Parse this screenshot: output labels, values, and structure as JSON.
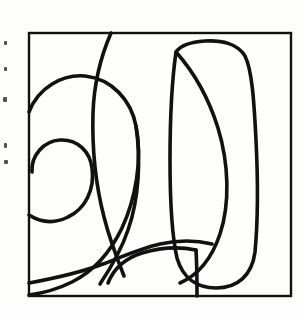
{
  "page": {
    "title": "Abstract Continuous-Line Drawing",
    "background_color": "#fdfdfc",
    "width": 304,
    "height": 314
  },
  "artwork": {
    "name": "abstract-line-drawing",
    "medium": "ink line drawing",
    "ink_color": "#111111",
    "paper_color": "#fdfdfc",
    "stroke_width": 3.6,
    "description": "A square frame enclosing a set of continuous flowing curves forming a spiral at left and a tall rounded loop at right.",
    "frame": {
      "name": "square-frame",
      "x": 29,
      "y": 33,
      "width": 262,
      "height": 263,
      "stroke_width": 2.4,
      "color": "#111111"
    },
    "paths": [
      {
        "name": "outer-spiral-arc",
        "d": "M 29 112 C 38 88, 62 74, 85 76 C 112 79, 131 100, 136 126 C 143 160, 135 200, 122 228 C 110 253, 92 272, 72 282 C 58 289, 44 293, 29 295"
      },
      {
        "name": "inner-spiral-hook",
        "d": "M 32 172 C 31 155, 44 141, 60 140 C 78 139, 90 152, 92 168 C 95 190, 85 209, 68 217 C 54 224, 40 222, 29 215"
      },
      {
        "name": "descending-top-curve",
        "d": "M 111 33 C 101 56, 94 84, 93 113 C 92 148, 96 186, 104 217 C 110 241, 118 261, 124 276"
      },
      {
        "name": "spiral-outer-sweep-lower",
        "d": "M 136 126 C 141 160, 139 199, 128 230 C 120 254, 108 272, 100 284"
      },
      {
        "name": "right-loop-outline",
        "d": "M 176 52 C 172 80, 170 120, 170 160 C 170 200, 172 236, 177 258 C 183 279, 198 288, 216 288 C 238 288, 252 275, 255 252 C 258 220, 258 180, 256 140 C 254 100, 252 70, 245 56 C 238 44, 222 40, 205 41 C 190 42, 180 46, 176 52 Z"
      },
      {
        "name": "diagonal-crossing-curve",
        "d": "M 176 52 C 192 70, 208 96, 218 128 C 229 164, 230 204, 220 234 C 212 258, 198 275, 180 283"
      },
      {
        "name": "bottom-sweep-curve",
        "d": "M 29 283 C 56 278, 82 272, 103 264 C 124 256, 142 248, 160 244 C 178 240, 196 240, 212 244"
      },
      {
        "name": "bottom-inner-curve",
        "d": "M 108 283 C 114 268, 126 258, 142 253 C 162 247, 182 247, 196 250"
      },
      {
        "name": "bottom-vertical-stub",
        "d": "M 196 250 C 197 266, 197 282, 197 296"
      }
    ],
    "margin_marks": {
      "name": "scan-artifact-marks",
      "description": "Faint dark specks along the left paper margin",
      "color": "#2b2b2b",
      "items": [
        {
          "x": 4,
          "y": 41,
          "w": 3,
          "h": 4
        },
        {
          "x": 4,
          "y": 67,
          "w": 3,
          "h": 4
        },
        {
          "x": 3,
          "y": 97,
          "w": 4,
          "h": 5
        },
        {
          "x": 4,
          "y": 143,
          "w": 3,
          "h": 5
        },
        {
          "x": 4,
          "y": 160,
          "w": 4,
          "h": 4
        }
      ]
    }
  }
}
